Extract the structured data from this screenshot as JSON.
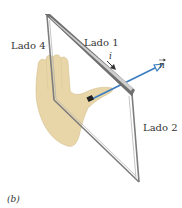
{
  "figure": {
    "panel_label": "(b)",
    "labels": {
      "side_4": "Lado 4",
      "side_1": "Lado 1",
      "side_2": "Lado 2",
      "current": "i",
      "normal": "n"
    },
    "colors": {
      "frame": "#8a8a8a",
      "frame_highlight": "#d9d9d9",
      "normal_vector": "#3d7fc1",
      "hand": "#e8d6a8",
      "hand_outline": "#cdb886",
      "text": "#333333"
    }
  }
}
